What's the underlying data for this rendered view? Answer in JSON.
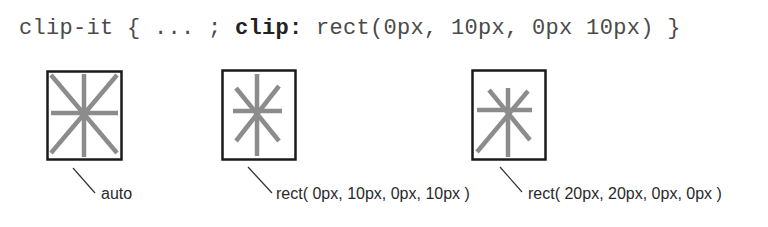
{
  "code_line": {
    "selector": "clip-it",
    "open": " { ... ; ",
    "property": "clip",
    "colon": ":",
    "value": " rect(0px, 10px, 0px 10px) }"
  },
  "figures": [
    {
      "label": "auto",
      "clip": "auto"
    },
    {
      "label": "rect( 0px, 10px, 0px, 10px )",
      "clip": "rect(0px,10px,0px,10px)"
    },
    {
      "label": "rect( 20px, 20px, 0px, 0px )",
      "clip": "rect(20px,20px,0px,0px)"
    }
  ],
  "colors": {
    "border": "#1a1a1a",
    "star": "#8c8c8c",
    "text": "#2a2a2a"
  }
}
